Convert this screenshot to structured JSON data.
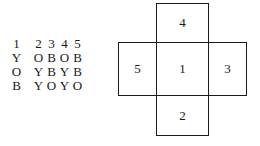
{
  "table": {
    "header": [
      "1",
      "2",
      "3",
      "4",
      "5"
    ],
    "rows": [
      [
        "Y",
        "O",
        "B",
        "O",
        "B"
      ],
      [
        "O",
        "Y",
        "B",
        "Y",
        "B"
      ],
      [
        "B",
        "Y",
        "O",
        "Y",
        "O"
      ]
    ]
  },
  "net": {
    "faces": {
      "top": "4",
      "left": "5",
      "center": "1",
      "right": "3",
      "bottom": "2"
    }
  }
}
